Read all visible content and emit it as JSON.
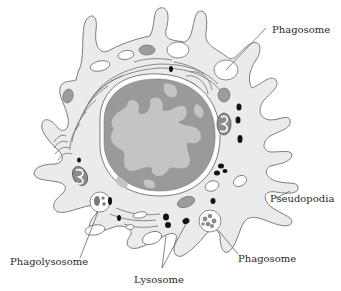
{
  "diagram": {
    "colors": {
      "background": "#ffffff",
      "cytoplasm": "#ebebeb",
      "outline": "#6e6e6e",
      "nucleus_dark": "#9a9a9a",
      "nucleus_light": "#c4c4c4",
      "organelle_gray": "#9c9c9c",
      "lysosome": "#111111",
      "vesicle": "#ffffff",
      "leader_line": "#555555"
    },
    "labels": [
      {
        "id": "phagosome-top",
        "text": "Phagosome"
      },
      {
        "id": "pseudopodia",
        "text": "Pseudopodia"
      },
      {
        "id": "phagolysosome",
        "text": "Phagolysosome"
      },
      {
        "id": "lysosome",
        "text": "Lysosome"
      },
      {
        "id": "phagosome-bottom",
        "text": "Phagosome"
      }
    ]
  }
}
